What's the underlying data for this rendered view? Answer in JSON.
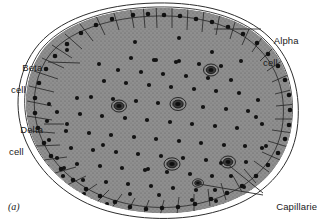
{
  "figure": {
    "caption": "(a)",
    "width": 317,
    "height": 223
  },
  "labels": {
    "beta": {
      "line1": "Beta",
      "line2": "cell"
    },
    "delta": {
      "line1": "Delta",
      "line2": "cell"
    },
    "alpha": {
      "line1": "Alpha",
      "line2": "cell"
    },
    "capillaries": {
      "line1": "Capillaries"
    }
  },
  "colors": {
    "background": "#ffffff",
    "outline": "#1a1a1a",
    "alpha_cell_fill": "#8f8f8f",
    "beta_cell_fill": "#c9c9c9",
    "delta_cell_fill": "#ffffff",
    "capillary_fill": "#2b2b2b",
    "nucleus": "#111111",
    "capsule_line": "#333333",
    "leader_line": "#2b2b2b",
    "text": "#1a1a1a"
  },
  "diagram_data": {
    "type": "labeled-biological-cross-section",
    "structure_counts": {
      "alpha_cells_outer_ring": 62,
      "beta_cells_core": 118,
      "delta_cells": 24,
      "capillaries": 6
    },
    "legend_entries": [
      {
        "name": "Alpha cell",
        "region": "outer rim",
        "shade": "dark stippled gray"
      },
      {
        "name": "Beta cell",
        "region": "central core",
        "shade": "light gray"
      },
      {
        "name": "Delta cell",
        "region": "scattered",
        "shade": "white"
      },
      {
        "name": "Capillaries",
        "region": "scattered",
        "shade": "dark concentric rings"
      }
    ],
    "leaders": [
      {
        "label": "beta",
        "from": [
          48,
          62
        ],
        "to": [
          80,
          63
        ]
      },
      {
        "label": "delta",
        "from": [
          46,
          124
        ],
        "to": [
          64,
          124
        ]
      },
      {
        "label": "alpha",
        "from": [
          261,
          29
        ],
        "to": [
          214,
          29
        ]
      },
      {
        "label": "capillaries-1",
        "from": [
          264,
          193
        ],
        "to": [
          225,
          162
        ]
      },
      {
        "label": "capillaries-2",
        "from": [
          264,
          195
        ],
        "to": [
          198,
          183
        ]
      }
    ]
  }
}
